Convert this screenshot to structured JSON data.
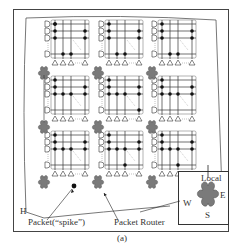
{
  "figure": {
    "caption": "(a)",
    "labels": {
      "packet": "Packet(“spike”)",
      "router": "Packet Router",
      "h": "H",
      "local": "Local",
      "east": "E",
      "west": "W",
      "south": "S"
    },
    "colors": {
      "frame": "#444444",
      "router_fill": "#7a7a7a",
      "router_stroke": "#5a5a5a",
      "grid": "#333333",
      "dot": "#111111",
      "dashed": "#999999"
    },
    "grid": {
      "rows": 3,
      "cols": 3,
      "tile_rows_label": [
        "D",
        "D",
        "D",
        "D"
      ],
      "tile_cols_label": [
        "△",
        "△",
        "△",
        "△"
      ]
    },
    "tiles": [
      {
        "x": 49,
        "y": 20,
        "dots": [
          [
            0,
            0
          ],
          [
            0,
            1
          ],
          [
            0,
            2
          ],
          [
            3,
            1
          ],
          [
            3,
            2
          ],
          [
            2,
            3
          ],
          [
            1,
            3
          ],
          [
            0,
            0
          ]
        ]
      },
      {
        "x": 103,
        "y": 20,
        "dots": [
          [
            0,
            0
          ],
          [
            0,
            1
          ],
          [
            0,
            2
          ],
          [
            3,
            1
          ],
          [
            3,
            2
          ],
          [
            2,
            3
          ],
          [
            1,
            3
          ]
        ]
      },
      {
        "x": 156,
        "y": 20,
        "dots": [
          [
            0,
            0
          ],
          [
            0,
            1
          ],
          [
            0,
            2
          ],
          [
            3,
            1
          ],
          [
            3,
            2
          ],
          [
            2,
            3
          ],
          [
            1,
            3
          ]
        ]
      },
      {
        "x": 49,
        "y": 76,
        "dots": [
          [
            0,
            0
          ],
          [
            0,
            1
          ],
          [
            0,
            2
          ],
          [
            1,
            2
          ],
          [
            2,
            2
          ],
          [
            3,
            1
          ],
          [
            3,
            2
          ]
        ]
      },
      {
        "x": 103,
        "y": 76,
        "dots": [
          [
            0,
            0
          ],
          [
            0,
            1
          ],
          [
            0,
            2
          ],
          [
            1,
            2
          ],
          [
            2,
            2
          ],
          [
            3,
            1
          ],
          [
            3,
            2
          ],
          [
            3,
            3
          ]
        ]
      },
      {
        "x": 156,
        "y": 76,
        "dots": [
          [
            0,
            0
          ],
          [
            0,
            1
          ],
          [
            0,
            2
          ],
          [
            1,
            2
          ],
          [
            2,
            2
          ],
          [
            3,
            1
          ],
          [
            3,
            2
          ]
        ]
      },
      {
        "x": 49,
        "y": 131,
        "dots": [
          [
            0,
            0
          ],
          [
            0,
            1
          ],
          [
            0,
            2
          ],
          [
            1,
            2
          ],
          [
            2,
            2
          ],
          [
            3,
            1
          ],
          [
            3,
            2
          ]
        ]
      },
      {
        "x": 103,
        "y": 131,
        "dots": [
          [
            0,
            0
          ],
          [
            0,
            1
          ],
          [
            0,
            2
          ],
          [
            1,
            2
          ],
          [
            2,
            2
          ],
          [
            3,
            1
          ],
          [
            3,
            2
          ],
          [
            2,
            3
          ]
        ]
      },
      {
        "x": 156,
        "y": 131,
        "dots": [
          [
            0,
            0
          ],
          [
            0,
            1
          ],
          [
            0,
            2
          ],
          [
            1,
            2
          ],
          [
            2,
            2
          ],
          [
            3,
            1
          ],
          [
            3,
            2
          ],
          [
            2,
            3
          ]
        ]
      }
    ],
    "routers": [
      [
        44,
        71
      ],
      [
        98,
        71
      ],
      [
        152,
        71
      ],
      [
        44,
        125
      ],
      [
        98,
        125
      ],
      [
        152,
        125
      ],
      [
        44,
        180
      ],
      [
        98,
        180
      ],
      [
        152,
        180
      ]
    ]
  }
}
